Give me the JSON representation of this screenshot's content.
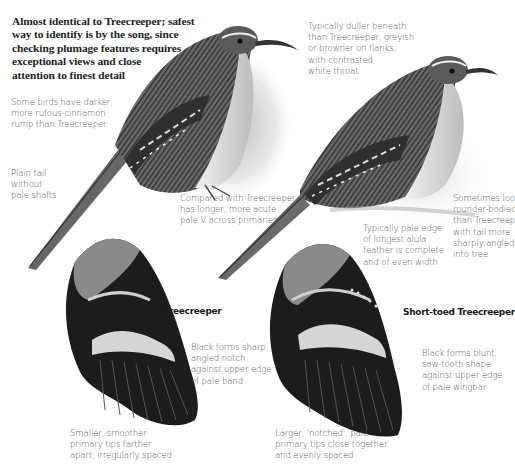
{
  "intro": {
    "lines": [
      "Almost identical to Treecreeper; safest",
      "way to identify is by the song, since",
      "checking plumage features requires",
      "exceptional views and close",
      "attention to finest detail"
    ]
  },
  "annotations": {
    "rump": [
      "Some birds have darker,",
      "more rufous-cinnamon",
      "rump than Treecreeper"
    ],
    "tail": [
      "Plain tail",
      "without",
      "pale shafts"
    ],
    "underparts": [
      "Typically duller beneath",
      "than Treecreeper, greyish",
      "or browner on flanks,",
      "with contrasted",
      "white throat"
    ],
    "primaries_v": [
      "Compared with Treecreeper",
      "has longer, more acute",
      "pale V across primaries"
    ],
    "alula": [
      "Typically pale edge",
      "of longest alula",
      "feather is complete",
      "and of even width"
    ],
    "body_shape": [
      "Sometimes looks",
      "rounder-bodied",
      "than Treecreeper,",
      "with tail more",
      "sharply angled",
      "into tree"
    ],
    "tc_notch": [
      "Black forms sharp,",
      "angled notch",
      "against upper edge",
      "of pale band"
    ],
    "tc_tips": [
      "Smaller, smoother",
      "primary tips farther",
      "apart, irregularly spaced"
    ],
    "stc_notch": [
      "Black forms blunt,",
      "saw-tooth shape",
      "against upper edge",
      "of pale wingbar"
    ],
    "stc_tips": [
      "Larger, 'notched', pale",
      "primary tips close together",
      "and evenly spaced"
    ]
  },
  "wing_labels": {
    "left": "Treecreeper",
    "right": "Short-toed Treecreeper"
  },
  "colors": {
    "ink": "#1a1a1a",
    "note_text": "#555555",
    "plumage_dark": "#2b2b2b",
    "plumage_mid": "#7a7a7a",
    "plumage_light": "#c9c9c9",
    "wash": "#d8d8d8"
  }
}
